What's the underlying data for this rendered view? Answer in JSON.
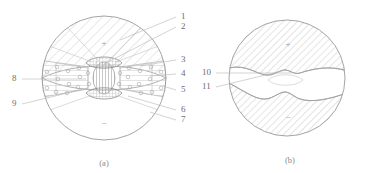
{
  "figure": {
    "background_color": "#ffffff",
    "line_color": "#9a9a9a",
    "hatch_color": "#b4b4b4",
    "label_color": "#6d6d6d",
    "caption_color": "#8a8a8a"
  },
  "panel_a": {
    "caption": "(a)",
    "polarity_top": "+",
    "polarity_bottom": "−",
    "labels_right": [
      {
        "id": "1",
        "text": "1"
      },
      {
        "id": "2",
        "text": "2"
      },
      {
        "id": "3",
        "text": "3"
      },
      {
        "id": "4",
        "text": "4"
      },
      {
        "id": "5",
        "text": "5"
      },
      {
        "id": "6",
        "text": "6"
      },
      {
        "id": "7",
        "text": "7"
      }
    ],
    "labels_left": [
      {
        "id": "8",
        "text": "8"
      },
      {
        "id": "9",
        "text": "9"
      }
    ]
  },
  "panel_b": {
    "caption": "(b)",
    "polarity_top": "+",
    "polarity_bottom": "−",
    "labels_left": [
      {
        "id": "10",
        "text": "10"
      },
      {
        "id": "11",
        "text": "11"
      }
    ]
  }
}
